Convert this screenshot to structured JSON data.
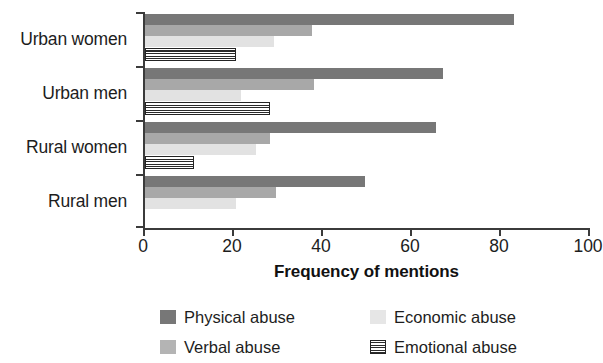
{
  "chart_data": {
    "type": "bar",
    "orientation": "horizontal",
    "title": "",
    "xlabel": "Frequency of mentions",
    "ylabel": "",
    "xlim": [
      0,
      100
    ],
    "xticks": [
      0,
      20,
      40,
      60,
      80,
      100
    ],
    "xtick_labels": [
      "0",
      "20",
      "40",
      "60",
      "80",
      "100"
    ],
    "grid": false,
    "legend_position": "bottom",
    "categories": [
      "Urban women",
      "Urban men",
      "Rural women",
      "Rural men"
    ],
    "series": [
      {
        "name": "Physical abuse",
        "color": "#777777",
        "values": [
          83,
          67,
          65.5,
          49.5
        ]
      },
      {
        "name": "Verbal abuse",
        "color": "#a8a8a8",
        "values": [
          37.5,
          38,
          28,
          29.5
        ]
      },
      {
        "name": "Economic abuse",
        "color": "#e2e2e2",
        "values": [
          29,
          21.5,
          25,
          20.5
        ]
      },
      {
        "name": "Emotional abuse",
        "color": "#ffffff",
        "pattern": "horizontal-stripes",
        "values": [
          20.5,
          28,
          11,
          0
        ]
      }
    ]
  },
  "legend": {
    "entries": [
      {
        "label": "Physical abuse",
        "swatch": "physical"
      },
      {
        "label": "Economic abuse",
        "swatch": "economic"
      },
      {
        "label": "Verbal abuse",
        "swatch": "verbal"
      },
      {
        "label": "Emotional abuse",
        "swatch": "emotional"
      }
    ]
  }
}
